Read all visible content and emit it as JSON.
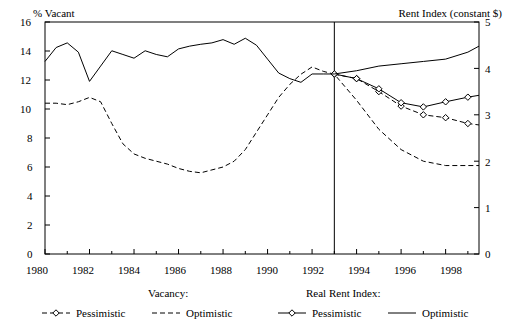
{
  "chart_data": {
    "type": "line",
    "title": "",
    "left_axis": {
      "label": "% Vacant",
      "ticks": [
        0,
        2,
        4,
        6,
        8,
        10,
        12,
        14,
        16
      ],
      "ylim": [
        0,
        16
      ]
    },
    "right_axis": {
      "label": "Rent Index (constant $)",
      "ticks": [
        0,
        1,
        2,
        3,
        4,
        5
      ],
      "ylim": [
        0,
        5
      ]
    },
    "xlabel": "",
    "xticks": [
      "1980",
      "1982",
      "1984",
      "1986",
      "1988",
      "1990",
      "1992",
      "1994",
      "1996",
      "1998"
    ],
    "xlim": [
      1980,
      1999.5
    ],
    "grid": false,
    "divider_x": 1993,
    "series": [
      {
        "name": "Vacancy: Pessimistic",
        "axis": "left",
        "style": "dashed-with-diamonds",
        "x": [
          1993,
          1994,
          1995,
          1996,
          1997,
          1998,
          1999,
          1999.5
        ],
        "values": [
          12.4,
          12.1,
          11.2,
          10.2,
          9.6,
          9.4,
          9.0,
          8.9
        ]
      },
      {
        "name": "Vacancy: Optimistic",
        "axis": "left",
        "style": "dashed",
        "x": [
          1980,
          1980.5,
          1981,
          1981.5,
          1982,
          1982.5,
          1983,
          1983.5,
          1984,
          1984.5,
          1985,
          1985.5,
          1986,
          1986.5,
          1987,
          1987.5,
          1988,
          1988.5,
          1989,
          1989.5,
          1990,
          1990.5,
          1991,
          1991.5,
          1992,
          1992.5,
          1993,
          1994,
          1995,
          1996,
          1997,
          1998,
          1999,
          1999.5
        ],
        "values": [
          10.4,
          10.4,
          10.3,
          10.5,
          10.8,
          10.5,
          9.0,
          7.6,
          6.9,
          6.6,
          6.4,
          6.2,
          5.9,
          5.7,
          5.6,
          5.8,
          6.0,
          6.4,
          7.2,
          8.4,
          9.6,
          10.8,
          11.7,
          12.4,
          12.9,
          12.6,
          12.4,
          10.6,
          8.6,
          7.2,
          6.4,
          6.1,
          6.1,
          6.1
        ]
      },
      {
        "name": "Real Rent Index: Pessimistic",
        "axis": "right",
        "style": "solid-with-diamonds",
        "x": [
          1993,
          1994,
          1995,
          1996,
          1997,
          1998,
          1999,
          1999.5
        ],
        "values": [
          3.88,
          3.78,
          3.56,
          3.26,
          3.17,
          3.28,
          3.38,
          3.42
        ]
      },
      {
        "name": "Real Rent Index: Optimistic",
        "axis": "right",
        "style": "solid",
        "x": [
          1980,
          1980.5,
          1981,
          1981.5,
          1982,
          1982.5,
          1983,
          1983.5,
          1984,
          1984.5,
          1985,
          1985.5,
          1986,
          1986.5,
          1987,
          1987.5,
          1988,
          1988.5,
          1989,
          1989.5,
          1990,
          1990.5,
          1991,
          1991.5,
          1992,
          1992.5,
          1993,
          1994,
          1995,
          1996,
          1997,
          1998,
          1999,
          1999.5
        ],
        "values": [
          4.15,
          4.45,
          4.55,
          4.35,
          3.72,
          4.05,
          4.38,
          4.3,
          4.22,
          4.38,
          4.3,
          4.25,
          4.42,
          4.48,
          4.52,
          4.55,
          4.62,
          4.52,
          4.65,
          4.5,
          4.2,
          3.9,
          3.78,
          3.7,
          3.88,
          3.88,
          3.88,
          3.95,
          4.05,
          4.1,
          4.15,
          4.2,
          4.35,
          4.48
        ]
      }
    ]
  },
  "legend": {
    "group_left_label": "Vacancy:",
    "group_right_label": "Real Rent Index:",
    "items": [
      {
        "label": "Pessimistic",
        "marker": "dashed-diamond"
      },
      {
        "label": "Optimistic",
        "marker": "dashed"
      },
      {
        "label": "Pessimistic",
        "marker": "solid-diamond"
      },
      {
        "label": "Optimistic",
        "marker": "solid"
      }
    ]
  },
  "colors": {
    "line": "#000000",
    "background": "#ffffff"
  }
}
